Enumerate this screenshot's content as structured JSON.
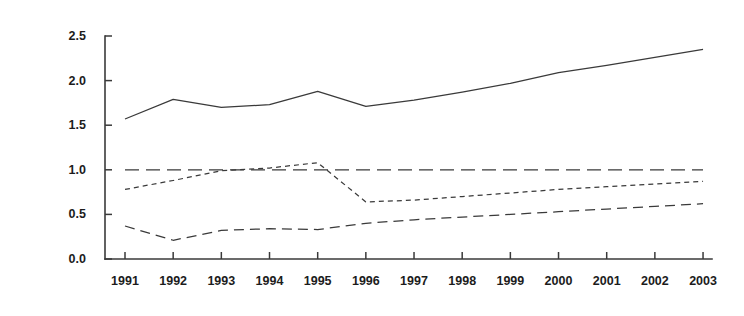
{
  "chart_data": {
    "type": "line",
    "title": "",
    "subtitle": "",
    "xlabel": "",
    "ylabel": "",
    "categories": [
      "1991",
      "1992",
      "1993",
      "1994",
      "1995",
      "1996",
      "1997",
      "1998",
      "1999",
      "2000",
      "2001",
      "2002",
      "2003"
    ],
    "x": [
      1991,
      1992,
      1993,
      1994,
      1995,
      1996,
      1997,
      1998,
      1999,
      2000,
      2001,
      2002,
      2003
    ],
    "xlim": [
      1990.6,
      2003.4
    ],
    "ylim": [
      0.0,
      2.5
    ],
    "y_ticks": [
      0.0,
      0.5,
      1.0,
      1.5,
      2.0,
      2.5
    ],
    "y_tick_labels": [
      "0.0",
      "0.5",
      "1.0",
      "1.5",
      "2.0",
      "2.5"
    ],
    "x_ticks": [
      1991,
      1992,
      1993,
      1994,
      1995,
      1996,
      1997,
      1998,
      1999,
      2000,
      2001,
      2002,
      2003
    ],
    "x_tick_labels": [
      "1991",
      "1992",
      "1993",
      "1994",
      "1995",
      "1996",
      "1997",
      "1998",
      "1999",
      "2000",
      "2001",
      "2002",
      "2003"
    ],
    "grid": false,
    "legend": "none",
    "axis_color": "#3a3a3a",
    "line_color": "#3a3a3a",
    "background": "#ffffff",
    "series": [
      {
        "name": "series-1",
        "style": "solid",
        "dash": "none",
        "color": "#3a3a3a",
        "values": [
          1.57,
          1.79,
          1.7,
          1.73,
          1.88,
          1.71,
          1.78,
          1.87,
          1.97,
          2.09,
          2.17,
          2.26,
          2.35
        ]
      },
      {
        "name": "series-2",
        "style": "long-dash",
        "dash": "14,7",
        "color": "#3a3a3a",
        "values": [
          1.0,
          1.0,
          1.0,
          1.0,
          1.0,
          1.0,
          1.0,
          1.0,
          1.0,
          1.0,
          1.0,
          1.0,
          1.0
        ]
      },
      {
        "name": "series-3",
        "style": "short-dash",
        "dash": "5,4",
        "color": "#3a3a3a",
        "values": [
          0.78,
          0.88,
          0.99,
          1.02,
          1.08,
          0.64,
          0.66,
          0.7,
          0.74,
          0.78,
          0.81,
          0.84,
          0.87
        ]
      },
      {
        "name": "series-4",
        "style": "medium-dash",
        "dash": "10,6",
        "color": "#3a3a3a",
        "values": [
          0.37,
          0.21,
          0.32,
          0.34,
          0.33,
          0.4,
          0.44,
          0.47,
          0.5,
          0.53,
          0.56,
          0.59,
          0.62
        ]
      }
    ]
  },
  "axes": {
    "y_axis_name": "value-axis",
    "x_axis_name": "year-axis"
  }
}
